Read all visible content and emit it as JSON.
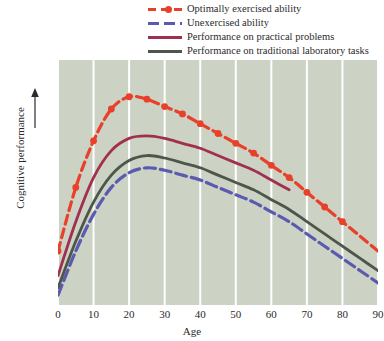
{
  "legend": {
    "position": "top-center",
    "items": [
      {
        "label": "Optimally exercised ability",
        "style": "dashed-with-marker",
        "color": "#e8402a",
        "icon": "legend-swatch-red-dashed"
      },
      {
        "label": "Unexercised ability",
        "style": "dashed",
        "color": "#5a5ab0",
        "icon": "legend-swatch-blue-dashed"
      },
      {
        "label": "Performance on practical problems",
        "style": "solid",
        "color": "#a03050",
        "icon": "legend-swatch-maroon-solid"
      },
      {
        "label": "Performance on  traditional laboratory tasks",
        "style": "solid",
        "color": "#4d564b",
        "icon": "legend-swatch-slate-solid"
      }
    ]
  },
  "axes": {
    "x_title": "Age",
    "y_title": "Cognitive performance",
    "x_ticks": [
      "0",
      "10",
      "20",
      "30",
      "40",
      "50",
      "60",
      "70",
      "80",
      "90"
    ],
    "y_arrow": "up-arrow"
  },
  "colors": {
    "plot_background": "#ccd2c4",
    "gridline": "#ffffff",
    "page_background": "#ffffff",
    "text": "#2b2b2b"
  },
  "chart_data": {
    "type": "line",
    "title": "",
    "xlabel": "Age",
    "ylabel": "Cognitive performance",
    "xlim": [
      0,
      90
    ],
    "ylim": [
      0,
      100
    ],
    "grid": "vertical-only",
    "legend_position": "top-center",
    "y_axis_labeled": false,
    "x": [
      0,
      5,
      10,
      15,
      20,
      25,
      30,
      35,
      40,
      45,
      50,
      55,
      60,
      65,
      70,
      75,
      80,
      85,
      90
    ],
    "series": [
      {
        "name": "Optimally exercised ability",
        "color": "#e8402a",
        "style": "dashed",
        "markers": true,
        "values": [
          22,
          48,
          67,
          80,
          85,
          84,
          81,
          78,
          74,
          70,
          66,
          62,
          57,
          52,
          46,
          40,
          34,
          28,
          22
        ]
      },
      {
        "name": "Unexercised ability",
        "color": "#5a5ab0",
        "style": "dashed",
        "markers": false,
        "values": [
          4,
          22,
          37,
          48,
          54,
          56,
          55,
          53,
          51,
          48,
          45,
          42,
          38,
          34,
          29,
          24,
          19,
          14,
          9
        ]
      },
      {
        "name": "Performance on practical problems",
        "color": "#a03050",
        "style": "solid",
        "markers": false,
        "x_end": 68,
        "values": [
          12,
          34,
          52,
          63,
          68,
          69,
          68,
          66,
          64,
          61,
          58,
          55,
          51,
          47,
          null,
          null,
          null,
          null,
          null
        ]
      },
      {
        "name": "Performance on  traditional laboratory tasks",
        "color": "#4d564b",
        "style": "solid",
        "markers": false,
        "values": [
          7,
          26,
          42,
          53,
          59,
          61,
          60,
          58,
          56,
          53,
          50,
          47,
          43,
          39,
          34,
          29,
          24,
          19,
          14
        ]
      }
    ],
    "marker_x": [
      0,
      5,
      10,
      15,
      20,
      25,
      30,
      35,
      40,
      45,
      50,
      55,
      60,
      65,
      70,
      75,
      80
    ]
  }
}
